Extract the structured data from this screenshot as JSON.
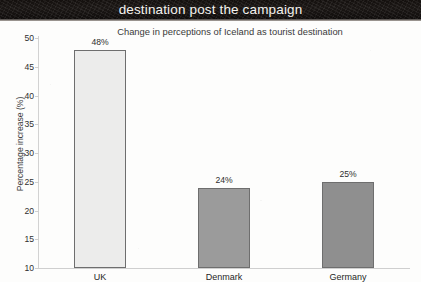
{
  "banner": {
    "title": "destination post the campaign"
  },
  "chart_data": {
    "type": "bar",
    "title": "Change in perceptions of Iceland as tourist destination",
    "xlabel": "",
    "ylabel": "Percentage increase (%)",
    "categories": [
      "UK",
      "Denmark",
      "Germany"
    ],
    "values": [
      48,
      24,
      25
    ],
    "data_labels": [
      "48%",
      "24%",
      "25%"
    ],
    "ylim": [
      10,
      50
    ],
    "yticks": [
      50,
      45,
      40,
      35,
      30,
      25,
      20,
      15,
      10
    ],
    "ytick_labels": [
      "50",
      "45",
      "40",
      "35",
      "30",
      "25",
      "20",
      "15",
      "10"
    ],
    "grid": false,
    "legend": false,
    "bar_colors": [
      "#ececeb",
      "#9b9b9b",
      "#8f8f8f"
    ],
    "bar_border_color": "#6e6e6e"
  }
}
